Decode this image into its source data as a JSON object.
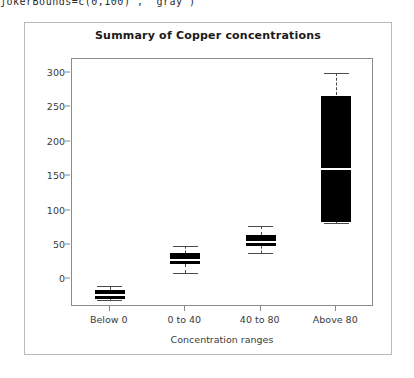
{
  "code_fragment": "jokerBounds=c(0,100)\", \"gray\")",
  "panel": {
    "title": "Summary of Copper concentrations"
  },
  "chart_data": {
    "type": "box",
    "title": "Summary of Copper concentrations",
    "xlabel": "Concentration ranges",
    "ylabel": "",
    "categories": [
      "Below 0",
      "0 to 40",
      "40 to 80",
      "Above 80"
    ],
    "ytick_labels": [
      "0",
      "50",
      "100",
      "150",
      "200",
      "250",
      "300"
    ],
    "ytick_values": [
      0,
      50,
      100,
      150,
      200,
      250,
      300
    ],
    "ylim": [
      -40,
      320
    ],
    "grid": false,
    "legend": null,
    "box_fill": "#000000",
    "median_color": "#ffffff",
    "whisker_color": "#4a4a4a",
    "boxes": [
      {
        "category": "Below 0",
        "whisker_low": -30,
        "q1": -28,
        "median": -22,
        "q3": -16,
        "whisker_high": -10
      },
      {
        "category": "0 to 40",
        "whisker_low": 10,
        "q1": 22,
        "median": 28,
        "q3": 38,
        "whisker_high": 48
      },
      {
        "category": "40 to 80",
        "whisker_low": 38,
        "q1": 48,
        "median": 55,
        "q3": 65,
        "whisker_high": 78
      },
      {
        "category": "Above 80",
        "whisker_low": 82,
        "q1": 83,
        "median": 160,
        "q3": 267,
        "whisker_high": 300
      }
    ]
  }
}
